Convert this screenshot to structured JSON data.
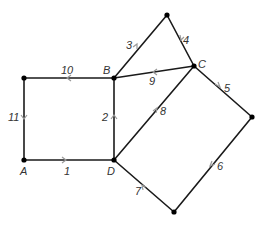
{
  "diagram": {
    "type": "directed-graph",
    "nodes": [
      {
        "id": "TL",
        "label": "",
        "x": 24,
        "y": 78
      },
      {
        "id": "B",
        "label": "B",
        "x": 114,
        "y": 78
      },
      {
        "id": "T",
        "label": "",
        "x": 167,
        "y": 15
      },
      {
        "id": "C",
        "label": "C",
        "x": 194,
        "y": 66
      },
      {
        "id": "A",
        "label": "A",
        "x": 24,
        "y": 160
      },
      {
        "id": "D",
        "label": "D",
        "x": 114,
        "y": 160
      },
      {
        "id": "R",
        "label": "",
        "x": 252,
        "y": 117
      },
      {
        "id": "Bot",
        "label": "",
        "x": 174,
        "y": 212
      }
    ],
    "edges": [
      {
        "label": "1",
        "from": "A",
        "to": "D"
      },
      {
        "label": "2",
        "from": "D",
        "to": "B"
      },
      {
        "label": "3",
        "from": "B",
        "to": "T"
      },
      {
        "label": "4",
        "from": "T",
        "to": "C"
      },
      {
        "label": "5",
        "from": "C",
        "to": "R"
      },
      {
        "label": "6",
        "from": "R",
        "to": "Bot"
      },
      {
        "label": "7",
        "from": "Bot",
        "to": "D"
      },
      {
        "label": "8",
        "from": "D",
        "to": "C"
      },
      {
        "label": "9",
        "from": "C",
        "to": "B"
      },
      {
        "label": "10",
        "from": "B",
        "to": "TL"
      },
      {
        "label": "11",
        "from": "TL",
        "to": "A"
      }
    ],
    "vertex_labels": {
      "A": "A",
      "B": "B",
      "C": "C",
      "D": "D"
    },
    "edge_labels": {
      "e1": "1",
      "e2": "2",
      "e3": "3",
      "e4": "4",
      "e5": "5",
      "e6": "6",
      "e7": "7",
      "e8": "8",
      "e9": "9",
      "e10": "10",
      "e11": "11"
    }
  }
}
